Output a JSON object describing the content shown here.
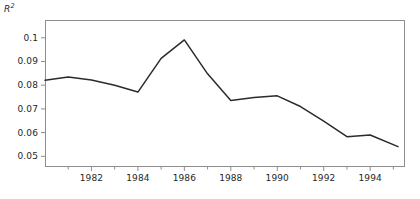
{
  "chart_data": {
    "type": "line",
    "title": "",
    "subtitle": "",
    "xlabel": "",
    "ylabel": "R²",
    "ylabel_plain": "R2",
    "grid": false,
    "legend": "none",
    "xlim": [
      1980,
      1995.5
    ],
    "ylim": [
      0.0455,
      0.1075
    ],
    "yticks": [
      0.05,
      0.06,
      0.07,
      0.08,
      0.09,
      0.1
    ],
    "ytick_labels": [
      "0.05",
      "0.06",
      "0.07",
      "0.08",
      "0.09",
      "0.1"
    ],
    "xticks": [
      1982,
      1984,
      1986,
      1988,
      1990,
      1992,
      1994
    ],
    "xtick_labels": [
      "1982",
      "1984",
      "1986",
      "1988",
      "1990",
      "1992",
      "1994"
    ],
    "xminor_ticks": [
      1981,
      1983,
      1985,
      1987,
      1989,
      1991,
      1993,
      1995
    ],
    "line_color": "#2b2b2b",
    "line_width": 1.5,
    "frame_color": "#8d8d8d",
    "background": "#ffffff",
    "x": [
      1980,
      1981,
      1982,
      1983,
      1984,
      1985,
      1986,
      1987,
      1988,
      1989,
      1990,
      1991,
      1992,
      1993,
      1994,
      1995.2
    ],
    "values": [
      0.0821,
      0.0835,
      0.0822,
      0.08,
      0.0771,
      0.0913,
      0.0991,
      0.0848,
      0.0735,
      0.0748,
      0.0755,
      0.071,
      0.0648,
      0.0583,
      0.059,
      0.0541
    ],
    "series": [
      {
        "name": "R2",
        "values": [
          0.0821,
          0.0835,
          0.0822,
          0.08,
          0.0771,
          0.0913,
          0.0991,
          0.0848,
          0.0735,
          0.0748,
          0.0755,
          0.071,
          0.0648,
          0.0583,
          0.059,
          0.0541
        ]
      }
    ],
    "annotations": []
  }
}
